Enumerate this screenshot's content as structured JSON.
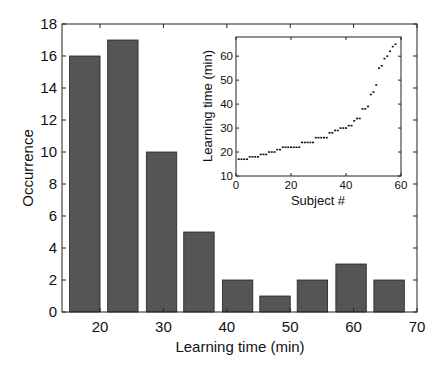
{
  "chart_data": [
    {
      "type": "bar",
      "title": "",
      "xlabel": "Learning time (min)",
      "ylabel": "Occurrence",
      "categories": [
        "17.6",
        "23.6",
        "29.7",
        "35.6",
        "41.7",
        "47.6",
        "53.5",
        "59.6",
        "65.6"
      ],
      "bin_centers": [
        17.6,
        23.6,
        29.7,
        35.6,
        41.7,
        47.6,
        53.5,
        59.6,
        65.6
      ],
      "values": [
        16,
        17,
        10,
        5,
        2,
        1,
        2,
        3,
        2
      ],
      "xlim": [
        14,
        70
      ],
      "ylim": [
        0,
        18
      ],
      "xticks": [
        20,
        30,
        40,
        50,
        60,
        70
      ],
      "yticks": [
        0,
        2,
        4,
        6,
        8,
        10,
        12,
        14,
        16,
        18
      ],
      "bar_color": "#555555",
      "grid": false,
      "legend": null
    },
    {
      "type": "scatter",
      "title": "",
      "xlabel": "Subject #",
      "ylabel": "Learning time (min)",
      "x": [
        1,
        2,
        3,
        4,
        5,
        6,
        7,
        8,
        9,
        10,
        11,
        12,
        13,
        14,
        15,
        16,
        17,
        18,
        19,
        20,
        21,
        22,
        23,
        24,
        25,
        26,
        27,
        28,
        29,
        30,
        31,
        32,
        33,
        34,
        35,
        36,
        37,
        38,
        39,
        40,
        41,
        42,
        43,
        44,
        45,
        46,
        47,
        48,
        49,
        50,
        51,
        52,
        53,
        54,
        55,
        56,
        57,
        58
      ],
      "y": [
        17,
        17,
        17,
        17,
        18,
        18,
        18,
        18,
        19,
        19,
        19,
        20,
        20,
        20,
        21,
        21,
        22,
        22,
        22,
        22,
        22,
        22,
        22,
        24,
        24,
        24,
        24,
        24,
        26,
        26,
        26,
        26,
        26,
        28,
        28,
        29,
        29,
        30,
        30,
        30,
        31,
        31,
        33,
        34,
        34,
        38,
        38,
        39,
        44,
        45,
        48,
        55,
        56,
        59,
        60,
        62,
        64,
        65
      ],
      "xlim": [
        0,
        60
      ],
      "ylim": [
        10,
        68
      ],
      "xticks": [
        0,
        20,
        40,
        60
      ],
      "yticks": [
        10,
        20,
        30,
        40,
        50,
        60
      ],
      "position": "inset, upper right",
      "grid": false
    }
  ],
  "main": {
    "xlabel": "Learning time (min)",
    "ylabel": "Occurrence",
    "xtick_labels": [
      "20",
      "30",
      "40",
      "50",
      "60",
      "70"
    ],
    "ytick_labels": [
      "0",
      "2",
      "4",
      "6",
      "8",
      "10",
      "12",
      "14",
      "16",
      "18"
    ]
  },
  "inset": {
    "xlabel": "Subject #",
    "ylabel": "Learning time (min)",
    "xtick_labels": [
      "0",
      "20",
      "40",
      "60"
    ],
    "ytick_labels": [
      "10",
      "20",
      "30",
      "40",
      "50",
      "60"
    ]
  }
}
